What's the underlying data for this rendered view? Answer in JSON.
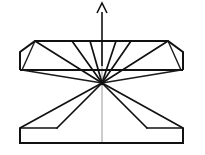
{
  "figure": {
    "stroke_color": "#111111",
    "axis_color": "#9a9a9a",
    "background_color": "#ffffff",
    "canvas": {
      "width": 205,
      "height": 155
    }
  },
  "geometry": {
    "hub": {
      "x": 102,
      "y": 83,
      "label": "convergence-point"
    },
    "upper_block": {
      "label": "upper-trapezoid",
      "points": "20,70 20,52 35,41 168,41 183,52 183,70",
      "top_y": 41,
      "bottom_y": 70,
      "left_x": 20,
      "right_x": 183
    },
    "lower_block": {
      "label": "lower-trapezoid",
      "points": "20,128 20,143 183,143 183,128",
      "top_y": 128,
      "bottom_y": 143,
      "left_x": 20,
      "right_x": 183
    },
    "centre_axis": {
      "x": 102,
      "y_top": 41,
      "y_bottom": 143
    },
    "arrow": {
      "label": "upward-arrow",
      "shaft_x": 102,
      "shaft_y_top": 12,
      "shaft_y_bottom": 66,
      "head_points": "97,13 102,3 107,13",
      "direction": "up"
    },
    "upper_rays": [
      {
        "name": "ray-upper-far-left",
        "x2": 35,
        "y2": 41
      },
      {
        "name": "ray-upper-left-mid",
        "x2": 72,
        "y2": 41
      },
      {
        "name": "ray-upper-left-near",
        "x2": 90,
        "y2": 41
      },
      {
        "name": "ray-upper-right-near",
        "x2": 116,
        "y2": 41
      },
      {
        "name": "ray-upper-right-mid",
        "x2": 131,
        "y2": 41
      },
      {
        "name": "ray-upper-far-right",
        "x2": 168,
        "y2": 41
      }
    ],
    "mid_rays": [
      {
        "name": "ray-mid-left",
        "x2": 22,
        "y2": 70
      },
      {
        "name": "ray-mid-right",
        "x2": 181,
        "y2": 70
      }
    ],
    "lower_rays": [
      {
        "name": "ray-lower-left-outer",
        "x2": 20,
        "y2": 128
      },
      {
        "name": "ray-lower-left-inner",
        "x2": 57,
        "y2": 128
      },
      {
        "name": "ray-lower-right-inner",
        "x2": 147,
        "y2": 128
      },
      {
        "name": "ray-lower-right-outer",
        "x2": 183,
        "y2": 128
      }
    ],
    "shoulder_lines": [
      {
        "name": "shoulder-left",
        "x1": 57,
        "y1": 128,
        "x2": 20,
        "y2": 128
      },
      {
        "name": "shoulder-right",
        "x1": 147,
        "y1": 128,
        "x2": 183,
        "y2": 128
      }
    ],
    "upper_chords": [
      {
        "name": "chord-upper-left",
        "x1": 35,
        "y1": 41,
        "x2": 22,
        "y2": 70
      },
      {
        "name": "chord-upper-right",
        "x1": 168,
        "y1": 41,
        "x2": 181,
        "y2": 70
      }
    ]
  }
}
